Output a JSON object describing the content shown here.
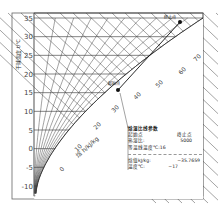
{
  "chart_data": {
    "type": "line",
    "title": "",
    "xlabel": "",
    "ylabel": "干球温度 t/℃",
    "y_axis": {
      "ticks": [
        -10,
        -5,
        0,
        5,
        10,
        15,
        20,
        25,
        30,
        35
      ],
      "range": [
        -12,
        36
      ]
    },
    "enthalpy_axis": {
      "label": "焓 h/kJ/kg",
      "ticks": [
        0,
        10,
        20,
        30,
        40,
        50,
        60,
        70
      ]
    },
    "grid": true,
    "points": [
      {
        "name": "起始点",
        "x": 118,
        "y": 90
      },
      {
        "name": "终止点",
        "x": 180,
        "y": 22
      }
    ],
    "process_line": {
      "from": "起始点",
      "to": "终止点"
    }
  },
  "info_box": {
    "title": "焓湿比线参数",
    "rows": [
      {
        "label": "起始点",
        "value": "终止点"
      },
      {
        "label": "热湿比:",
        "value": "5000"
      },
      {
        "label": "等温线温度℃:",
        "value": "16"
      }
    ],
    "rows2": [
      {
        "label": "焓值kJ/kg:",
        "value": "−35.7659"
      },
      {
        "label": "温度℃:",
        "value": "−17"
      }
    ]
  },
  "colors": {
    "grid": "#333333",
    "frame": "#555555",
    "point": "#111111"
  }
}
